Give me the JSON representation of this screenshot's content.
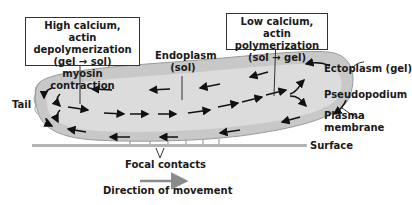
{
  "diagram": {
    "type": "amoeboid-cell-movement",
    "callout_left": {
      "line1": "High calcium,",
      "line2": "actin depolymerization",
      "line3": "(gel → sol)",
      "line4": "myosin contraction"
    },
    "callout_right": {
      "line1": "Low calcium,",
      "line2": "actin polymerization",
      "line3": "(sol → gel)"
    },
    "labels": {
      "endoplasm_line1": "Endoplasm",
      "endoplasm_line2": "(sol)",
      "ectoplasm": "Ectoplasm (gel)",
      "pseudopodium": "Pseudopodium",
      "plasma_line1": "Plasma",
      "plasma_line2": "membrane",
      "tail": "Tail",
      "surface": "Surface",
      "focal_contacts": "Focal contacts",
      "direction": "Direction of movement"
    },
    "colors": {
      "cell_fill": "#dcdcdc",
      "ectoplasm_fill": "#c8c8c8",
      "surface": "#b4b4b4",
      "arrow": "#111111",
      "direction_arrow": "#8a8a8a"
    }
  }
}
